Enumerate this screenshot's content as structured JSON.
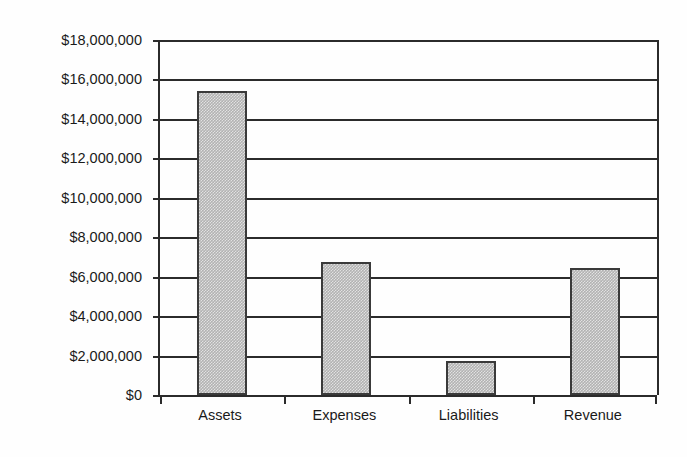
{
  "chart_data": {
    "type": "bar",
    "title": "",
    "subtitle": "",
    "xlabel": "",
    "ylabel": "",
    "categories": [
      "Assets",
      "Expenses",
      "Liabilities",
      "Revenue"
    ],
    "values": [
      15440000,
      6750000,
      1750000,
      6450000
    ],
    "series": [
      {
        "name": "Amount",
        "values": [
          15440000,
          6750000,
          1750000,
          6450000
        ]
      }
    ],
    "ylim": [
      0,
      18000000
    ],
    "ytick_step": 2000000,
    "ytick_labels": [
      "$18,000,000",
      "$16,000,000",
      "$14,000,000",
      "$12,000,000",
      "$10,000,000",
      "$8,000,000",
      "$6,000,000",
      "$4,000,000",
      "$2,000,000",
      "$0"
    ],
    "ytick_values": [
      18000000,
      16000000,
      14000000,
      12000000,
      10000000,
      8000000,
      6000000,
      4000000,
      2000000,
      0
    ],
    "grid": true,
    "grid_axis": "y",
    "legend": false,
    "legend_position": "none",
    "annotations": [],
    "colors": {
      "background": "#fefefe",
      "axis": "#2b2b2b",
      "grid": "#2b2b2b",
      "bar_fill": "#b2b2b2",
      "bar_border": "#3a3a3a",
      "text": "#1a1a1a"
    }
  }
}
